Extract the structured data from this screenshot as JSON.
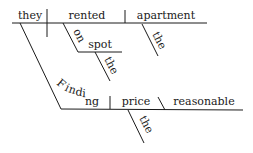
{
  "diagram": {
    "type": "Reed-Kellogg sentence diagram",
    "main_clause": {
      "subject": "they",
      "verb": "rented",
      "object": "apartment",
      "object_modifier": "the",
      "prepositional_phrase": {
        "preposition": "on",
        "object": "spot",
        "object_modifier": "the"
      }
    },
    "subject_clause": {
      "gerund": "Finding",
      "object": "price",
      "object_modifier": "the",
      "object_complement": "reasonable"
    },
    "colors": {
      "ink": "#1a1a1a",
      "background": "#ffffff"
    }
  }
}
